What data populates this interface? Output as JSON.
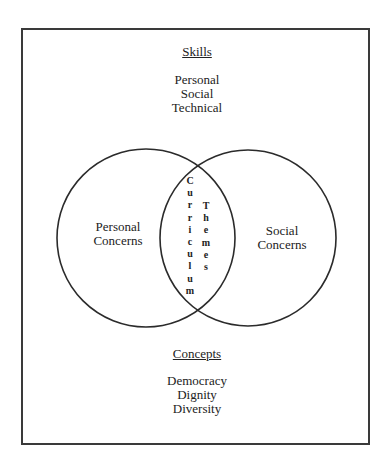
{
  "skills": {
    "heading": "Skills",
    "items": [
      "Personal",
      "Social",
      "Technical"
    ]
  },
  "venn": {
    "left_label": [
      "Personal",
      "Concerns"
    ],
    "right_label": [
      "Social",
      "Concerns"
    ],
    "intersection_vertical_left": "Curriculum",
    "intersection_vertical_right": "Themes"
  },
  "concepts": {
    "heading": "Concepts",
    "items": [
      "Democracy",
      "Dignity",
      "Diversity"
    ]
  },
  "colors": {
    "stroke": "#2b2b2b",
    "background": "#ffffff"
  }
}
